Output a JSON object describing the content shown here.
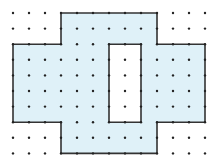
{
  "diagram": {
    "type": "dot-grid-shape",
    "grid": {
      "columns": 13,
      "rows": 10,
      "origin_x": 13,
      "origin_y": 13,
      "spacing_x": 16,
      "spacing_y": 15.6,
      "dot_radius": 1.2,
      "dot_color": "#222222"
    },
    "shape": {
      "fill": "#dff1f8",
      "stroke": "#333333",
      "stroke_width": 1.6,
      "outer": [
        [
          3,
          0
        ],
        [
          9,
          0
        ],
        [
          9,
          2
        ],
        [
          12,
          2
        ],
        [
          12,
          7
        ],
        [
          9,
          7
        ],
        [
          9,
          9
        ],
        [
          3,
          9
        ],
        [
          3,
          7
        ],
        [
          0,
          7
        ],
        [
          0,
          2
        ],
        [
          3,
          2
        ]
      ],
      "hole": [
        [
          6,
          2
        ],
        [
          8,
          2
        ],
        [
          8,
          7
        ],
        [
          6,
          7
        ]
      ]
    }
  }
}
